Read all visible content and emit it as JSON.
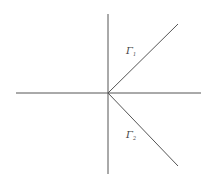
{
  "diagram": {
    "type": "contour-rays",
    "colors": {
      "line": "#555555",
      "background": "#ffffff"
    },
    "axes": {
      "horizontal": {
        "x1": 16,
        "y1": 93,
        "x2": 201,
        "y2": 93
      },
      "vertical": {
        "x1": 108,
        "y1": 14,
        "x2": 108,
        "y2": 174
      }
    },
    "origin": {
      "x": 108,
      "y": 93
    },
    "rays": [
      {
        "name": "Gamma 1",
        "x2": 178,
        "y2": 24,
        "label": "Γ",
        "subscript": "1",
        "label_x": 126,
        "label_y": 54
      },
      {
        "name": "Gamma 2",
        "x2": 178,
        "y2": 166,
        "label": "Γ",
        "subscript": "2",
        "label_x": 126,
        "label_y": 138
      }
    ]
  }
}
